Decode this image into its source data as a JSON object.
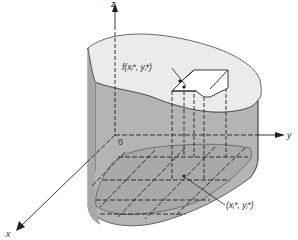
{
  "diagram": {
    "type": "3d-solid-riemann-column",
    "axes": {
      "x_label": "x",
      "y_label": "y",
      "z_label": "z",
      "origin_label": "0"
    },
    "labels": {
      "height_label": "f(xᵢ*, yⱼ*)",
      "point_label": "(xᵢ*, yⱼ*)"
    },
    "colors": {
      "top_surface": "#ebebeb",
      "side_wall": "#b4b4b4",
      "base_region": "#a9a9a9",
      "column_top": "#ffffff",
      "lines": "#222222",
      "background": "#ffffff"
    }
  }
}
